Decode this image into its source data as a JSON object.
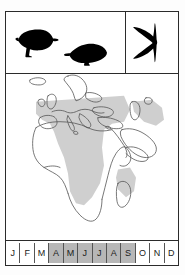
{
  "plate": {
    "title": "Species distribution plate",
    "silhouettes": [
      {
        "name": "perched-bird-left",
        "pose": "perched, facing right",
        "color": "#000000"
      },
      {
        "name": "perched-bird-right",
        "pose": "perched, facing left",
        "color": "#000000"
      },
      {
        "name": "flying-bird",
        "pose": "in flight, swept-back wings",
        "color": "#000000"
      }
    ],
    "map": {
      "region": "Europe, Africa and the Middle East",
      "coastline_color": "#555555",
      "range_shading_color": "#cfcfcf",
      "range_description": "Shaded resident and non-breeding range across sub-Saharan Africa, the Sahel belt, East Africa, southern Africa and Madagascar",
      "ocean_color": "#ffffff",
      "land_color": "#ffffff"
    },
    "month_bar": {
      "shaded_color": "#b7b7b7",
      "unshaded_color": "#ffffff",
      "months": [
        {
          "label": "J",
          "shaded": false
        },
        {
          "label": "F",
          "shaded": false
        },
        {
          "label": "M",
          "shaded": false
        },
        {
          "label": "A",
          "shaded": true
        },
        {
          "label": "M",
          "shaded": true
        },
        {
          "label": "J",
          "shaded": true
        },
        {
          "label": "J",
          "shaded": true
        },
        {
          "label": "A",
          "shaded": true
        },
        {
          "label": "S",
          "shaded": true
        },
        {
          "label": "O",
          "shaded": false
        },
        {
          "label": "N",
          "shaded": false
        },
        {
          "label": "D",
          "shaded": false
        }
      ]
    }
  }
}
